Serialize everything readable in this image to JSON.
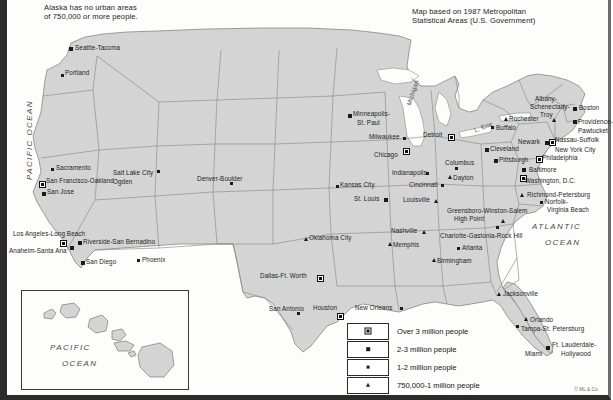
{
  "notes": {
    "alaska": "Alaska has no urban areas\nof 750,000 or more people.",
    "source": "Map based on 1987 Metropolitan\nStatistical Areas (U.S. Government)",
    "copyright": "© ML & Co."
  },
  "ocean_labels": {
    "pacific_main": "PACIFIC OCEAN",
    "atlantic": "ATLANTIC\nOCEAN",
    "pacific_inset": "PACIFIC\nOCEAN"
  },
  "legend": {
    "items": [
      {
        "symbol": "square-with-dot",
        "class": "s3",
        "label": "Over 3 million people"
      },
      {
        "symbol": "medium-square",
        "class": "s2",
        "label": "2-3 million people"
      },
      {
        "symbol": "small-square",
        "class": "s1",
        "label": "1-2 million people"
      },
      {
        "symbol": "triangle",
        "class": "s0",
        "label": "750,000-1 million people"
      }
    ]
  },
  "lake_labels": [
    {
      "name": "Michigan",
      "x": 398,
      "y": 104,
      "rot": -72
    },
    {
      "name": "L. Erie",
      "x": 466,
      "y": 127,
      "rot": -22
    }
  ],
  "cities": [
    {
      "name": "Seattle-Tacoma",
      "class": "s2",
      "sx": 62,
      "sy": 47,
      "lx": 68,
      "ly": 44,
      "align": "left"
    },
    {
      "name": "Portland",
      "class": "s1",
      "sx": 54,
      "sy": 74,
      "lx": 58,
      "ly": 69,
      "align": "left"
    },
    {
      "name": "Sacramento",
      "class": "s1",
      "sx": 44,
      "sy": 168,
      "lx": 49,
      "ly": 164,
      "align": "left"
    },
    {
      "name": "San Francisco-Oakland",
      "class": "s3",
      "sx": 32,
      "sy": 181,
      "lx": 39,
      "ly": 177,
      "align": "left"
    },
    {
      "name": "San Jose",
      "class": "s2",
      "sx": 35,
      "sy": 192,
      "lx": 40,
      "ly": 188,
      "align": "left"
    },
    {
      "name": "Los Angeles-Long Beach",
      "class": "s3",
      "sx": 53,
      "sy": 240,
      "lx": 6,
      "ly": 230,
      "align": "left"
    },
    {
      "name": "Anaheim-Santa Ana",
      "class": "s2",
      "sx": 63,
      "sy": 246,
      "lx": 2,
      "ly": 247,
      "align": "left"
    },
    {
      "name": "Riverside-San Bernadino",
      "class": "s2",
      "sx": 71,
      "sy": 241,
      "lx": 76,
      "ly": 238,
      "align": "left"
    },
    {
      "name": "San Diego",
      "class": "s2",
      "sx": 74,
      "sy": 261,
      "lx": 79,
      "ly": 258,
      "align": "left"
    },
    {
      "name": "Phoenix",
      "class": "s1",
      "sx": 130,
      "sy": 259,
      "lx": 135,
      "ly": 256,
      "align": "left"
    },
    {
      "name": "Salt Lake City",
      "class": "s1",
      "sx": 150,
      "sy": 170,
      "lx": 106,
      "ly": 169,
      "align": "left"
    },
    {
      "name": "Ogden",
      "class": "none",
      "sx": 0,
      "sy": 0,
      "lx": 106,
      "ly": 178,
      "align": "left"
    },
    {
      "name": "Denver-Boulder",
      "class": "s1",
      "sx": 223,
      "sy": 182,
      "lx": 190,
      "ly": 175,
      "align": "left"
    },
    {
      "name": "Minneapolis-",
      "class": "s2",
      "sx": 341,
      "sy": 114,
      "lx": 346,
      "ly": 110,
      "align": "left"
    },
    {
      "name": "St. Paul",
      "class": "none",
      "sx": 0,
      "sy": 0,
      "lx": 350,
      "ly": 119,
      "align": "left"
    },
    {
      "name": "Milwaukee",
      "class": "s1",
      "sx": 396,
      "sy": 137,
      "lx": 362,
      "ly": 133,
      "align": "left"
    },
    {
      "name": "Chicago",
      "class": "s3",
      "sx": 396,
      "sy": 148,
      "lx": 367,
      "ly": 151,
      "align": "left"
    },
    {
      "name": "Detroit",
      "class": "s3",
      "sx": 441,
      "sy": 134,
      "lx": 416,
      "ly": 131,
      "align": "left"
    },
    {
      "name": "Indianapolis",
      "class": "s1",
      "sx": 419,
      "sy": 172,
      "lx": 385,
      "ly": 169,
      "align": "left"
    },
    {
      "name": "Cincinnati",
      "class": "s1",
      "sx": 434,
      "sy": 184,
      "lx": 402,
      "ly": 181,
      "align": "left"
    },
    {
      "name": "Columbus",
      "class": "s1",
      "sx": 448,
      "sy": 167,
      "lx": 438,
      "ly": 159,
      "align": "left"
    },
    {
      "name": "Dayton",
      "class": "s0",
      "sx": 441,
      "sy": 175,
      "lx": 446,
      "ly": 174,
      "align": "left"
    },
    {
      "name": "Cleveland",
      "class": "s2",
      "sx": 478,
      "sy": 148,
      "lx": 483,
      "ly": 145,
      "align": "left"
    },
    {
      "name": "Pittsburgh",
      "class": "s2",
      "sx": 487,
      "sy": 159,
      "lx": 492,
      "ly": 156,
      "align": "left"
    },
    {
      "name": "Kansas City",
      "class": "s1",
      "sx": 329,
      "sy": 185,
      "lx": 333,
      "ly": 181,
      "align": "left"
    },
    {
      "name": "St. Louis",
      "class": "s2",
      "sx": 377,
      "sy": 198,
      "lx": 347,
      "ly": 195,
      "align": "left"
    },
    {
      "name": "Louisville",
      "class": "s0",
      "sx": 427,
      "sy": 199,
      "lx": 396,
      "ly": 196,
      "align": "left"
    },
    {
      "name": "Oklahoma City",
      "class": "s0",
      "sx": 297,
      "sy": 237,
      "lx": 302,
      "ly": 234,
      "align": "left"
    },
    {
      "name": "Dallas-Ft. Worth",
      "class": "s3",
      "sx": 310,
      "sy": 275,
      "lx": 253,
      "ly": 272,
      "align": "left"
    },
    {
      "name": "San Antonio",
      "class": "s1",
      "sx": 290,
      "sy": 312,
      "lx": 262,
      "ly": 305,
      "align": "left"
    },
    {
      "name": "Houston",
      "class": "s3",
      "sx": 330,
      "sy": 313,
      "lx": 306,
      "ly": 304,
      "align": "left"
    },
    {
      "name": "New Orleans",
      "class": "s1",
      "sx": 393,
      "sy": 307,
      "lx": 348,
      "ly": 304,
      "align": "left"
    },
    {
      "name": "Memphis",
      "class": "s0",
      "sx": 381,
      "sy": 242,
      "lx": 386,
      "ly": 241,
      "align": "left"
    },
    {
      "name": "Nashville",
      "class": "s0",
      "sx": 415,
      "sy": 230,
      "lx": 384,
      "ly": 227,
      "align": "left"
    },
    {
      "name": "Birmingham",
      "class": "s0",
      "sx": 425,
      "sy": 258,
      "lx": 430,
      "ly": 257,
      "align": "left"
    },
    {
      "name": "Atlanta",
      "class": "s1",
      "sx": 450,
      "sy": 247,
      "lx": 455,
      "ly": 244,
      "align": "left"
    },
    {
      "name": "Greensboro-Winston-Salem",
      "class": "s0",
      "sx": 494,
      "sy": 219,
      "lx": 440,
      "ly": 207,
      "align": "left"
    },
    {
      "name": "High Point",
      "class": "none",
      "sx": 0,
      "sy": 0,
      "lx": 447,
      "ly": 215,
      "align": "left"
    },
    {
      "name": "Charlotte-Gastonia-Rock Hill",
      "class": "s1",
      "sx": 489,
      "sy": 226,
      "lx": 433,
      "ly": 232,
      "align": "left"
    },
    {
      "name": "Jacksonville",
      "class": "s0",
      "sx": 490,
      "sy": 292,
      "lx": 496,
      "ly": 290,
      "align": "left"
    },
    {
      "name": "Orlando",
      "class": "s0",
      "sx": 517,
      "sy": 317,
      "lx": 523,
      "ly": 316,
      "align": "left"
    },
    {
      "name": "Tampa-St. Petersburg",
      "class": "s1",
      "sx": 509,
      "sy": 325,
      "lx": 514,
      "ly": 325,
      "align": "left"
    },
    {
      "name": "Miami",
      "class": "s2",
      "sx": 539,
      "sy": 346,
      "lx": 518,
      "ly": 350,
      "align": "left"
    },
    {
      "name": "Ft. Lauderdale-",
      "class": "none",
      "sx": 0,
      "sy": 0,
      "lx": 545,
      "ly": 341,
      "align": "left"
    },
    {
      "name": "Hollywood",
      "class": "none",
      "sx": 0,
      "sy": 0,
      "lx": 554,
      "ly": 350,
      "align": "left"
    },
    {
      "name": "Richmond-Petersburg",
      "class": "s0",
      "sx": 513,
      "sy": 193,
      "lx": 520,
      "ly": 191,
      "align": "left"
    },
    {
      "name": "Norfolk-",
      "class": "s1",
      "sx": 533,
      "sy": 201,
      "lx": 538,
      "ly": 198,
      "align": "left"
    },
    {
      "name": "Virginia Beach",
      "class": "none",
      "sx": 0,
      "sy": 0,
      "lx": 540,
      "ly": 206,
      "align": "left"
    },
    {
      "name": "Washington, D.C.",
      "class": "s3",
      "sx": 513,
      "sy": 175,
      "lx": 518,
      "ly": 177,
      "align": "left"
    },
    {
      "name": "Baltimore",
      "class": "s2",
      "sx": 515,
      "sy": 168,
      "lx": 522,
      "ly": 166,
      "align": "left"
    },
    {
      "name": "Philadelphia",
      "class": "s3",
      "sx": 529,
      "sy": 156,
      "lx": 535,
      "ly": 154,
      "align": "left"
    },
    {
      "name": "Newark",
      "class": "s2",
      "sx": 538,
      "sy": 141,
      "lx": 511,
      "ly": 138,
      "align": "left"
    },
    {
      "name": "Nassau-Suffolk",
      "class": "s3",
      "sx": 542,
      "sy": 139,
      "lx": 548,
      "ly": 136,
      "align": "left"
    },
    {
      "name": "New York City",
      "class": "none",
      "sx": 0,
      "sy": 0,
      "lx": 548,
      "ly": 146,
      "align": "left"
    },
    {
      "name": "Providence-",
      "class": "s2",
      "sx": 566,
      "sy": 120,
      "lx": 571,
      "ly": 118,
      "align": "left"
    },
    {
      "name": "Pawtucket",
      "class": "none",
      "sx": 0,
      "sy": 0,
      "lx": 571,
      "ly": 127,
      "align": "left"
    },
    {
      "name": "Boston",
      "class": "s2",
      "sx": 566,
      "sy": 107,
      "lx": 572,
      "ly": 104,
      "align": "left"
    },
    {
      "name": "Albany-",
      "class": "none",
      "sx": 0,
      "sy": 0,
      "lx": 528,
      "ly": 95,
      "align": "left"
    },
    {
      "name": "Schenectady-",
      "class": "none",
      "sx": 0,
      "sy": 0,
      "lx": 523,
      "ly": 103,
      "align": "left"
    },
    {
      "name": "Troy",
      "class": "s0",
      "sx": 545,
      "sy": 118,
      "lx": 533,
      "ly": 111,
      "align": "left"
    },
    {
      "name": "Rochester",
      "class": "s0",
      "sx": 497,
      "sy": 117,
      "lx": 502,
      "ly": 115,
      "align": "left"
    },
    {
      "name": "Buffalo",
      "class": "s1",
      "sx": 484,
      "sy": 126,
      "lx": 489,
      "ly": 124,
      "align": "left"
    },
    {
      "name": "Honolulu",
      "class": "s0",
      "sx": 79,
      "sy": 318,
      "lx": 84,
      "ly": 314,
      "align": "left"
    }
  ]
}
